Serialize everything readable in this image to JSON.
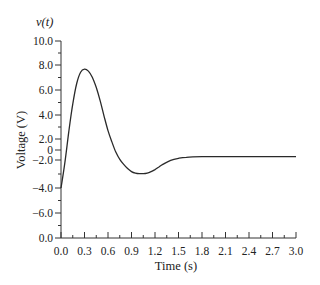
{
  "chart_data": {
    "type": "line",
    "title": "",
    "function_label": "v(t)",
    "xlabel": "Time (s)",
    "ylabel": "Voltage (V)",
    "xlim": [
      0.0,
      3.0
    ],
    "ylim_labels_top_to_bottom": [
      "10.0",
      "8.0",
      "6.0",
      "4.0",
      "2.0",
      "0",
      "-2.0",
      "-4.0",
      "-6.0",
      "0.0"
    ],
    "x_ticks": [
      "0.0",
      "0.3",
      "0.6",
      "0.9",
      "1.2",
      "1.5",
      "1.8",
      "2.1",
      "2.4",
      "2.7",
      "3.0"
    ],
    "grid": false,
    "legend": null,
    "series": [
      {
        "name": "v(t)",
        "x": [
          0.0,
          0.05,
          0.1,
          0.15,
          0.2,
          0.25,
          0.3,
          0.35,
          0.4,
          0.45,
          0.5,
          0.55,
          0.6,
          0.65,
          0.7,
          0.75,
          0.8,
          0.85,
          0.9,
          0.95,
          1.0,
          1.05,
          1.1,
          1.15,
          1.2,
          1.25,
          1.3,
          1.4,
          1.5,
          1.6,
          1.8,
          2.0,
          2.2,
          2.4,
          2.6,
          2.8,
          3.0
        ],
        "values": [
          -4.0,
          -1.5,
          1.5,
          4.2,
          6.2,
          7.3,
          7.6,
          7.4,
          6.8,
          5.8,
          4.5,
          3.0,
          1.6,
          0.5,
          -0.5,
          -1.2,
          -1.7,
          -2.1,
          -2.4,
          -2.55,
          -2.6,
          -2.6,
          -2.55,
          -2.4,
          -2.2,
          -1.95,
          -1.7,
          -1.3,
          -1.1,
          -1.0,
          -0.95,
          -0.95,
          -0.95,
          -0.95,
          -0.95,
          -0.95,
          -0.95
        ]
      }
    ],
    "annotations": {
      "peak": {
        "t": 0.3,
        "v": 7.6
      },
      "trough": {
        "t": 1.05,
        "v": -2.6
      },
      "steady_state": -0.95,
      "initial": -4.0
    }
  }
}
